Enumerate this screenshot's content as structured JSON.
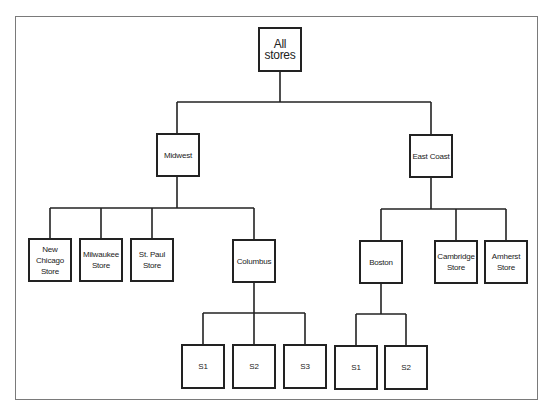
{
  "diagram": {
    "type": "org-tree",
    "root": "All stores",
    "nodes": {
      "all_stores": "All stores",
      "midwest": "Midwest",
      "east_coast": "East Coast",
      "new_chicago": "New Chicago\nStore",
      "milwaukee": "Milwaukee\nStore",
      "st_paul": "St. Paul\nStore",
      "columbus": "Columbus",
      "boston": "Boston",
      "cambridge": "Cambridge\nStore",
      "amherst": "Amherst\nStore",
      "columbus_s1": "S1",
      "columbus_s2": "S2",
      "columbus_s3": "S3",
      "boston_s1": "S1",
      "boston_s2": "S2"
    },
    "edges": [
      [
        "All stores",
        "Midwest"
      ],
      [
        "All stores",
        "East Coast"
      ],
      [
        "Midwest",
        "New Chicago Store"
      ],
      [
        "Midwest",
        "Milwaukee Store"
      ],
      [
        "Midwest",
        "St. Paul Store"
      ],
      [
        "Midwest",
        "Columbus"
      ],
      [
        "East Coast",
        "Boston"
      ],
      [
        "East Coast",
        "Cambridge Store"
      ],
      [
        "East Coast",
        "Amherst Store"
      ],
      [
        "Columbus",
        "S1"
      ],
      [
        "Columbus",
        "S2"
      ],
      [
        "Columbus",
        "S3"
      ],
      [
        "Boston",
        "S1"
      ],
      [
        "Boston",
        "S2"
      ]
    ]
  },
  "colors": {
    "line": "#222222",
    "frame": "#7a7a7a",
    "background": "#ffffff"
  }
}
